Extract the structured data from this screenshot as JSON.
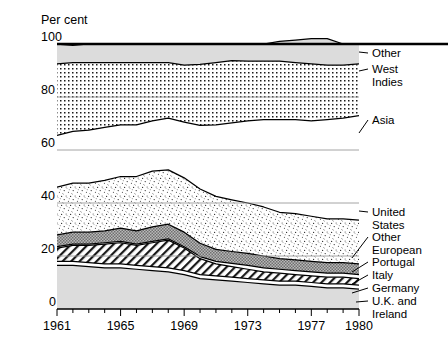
{
  "chart_data": {
    "type": "area",
    "title": "",
    "ylabel": "Per cent",
    "xlabel": "",
    "ylim": [
      0,
      100
    ],
    "xlim": [
      1961,
      1980
    ],
    "grid": true,
    "legend_position": "right",
    "stacked": true,
    "normalized": true,
    "y_ticks": [
      "0",
      "20",
      "40",
      "60",
      "80",
      "100"
    ],
    "y_tick_values": [
      0,
      20,
      40,
      60,
      80,
      100
    ],
    "x_ticks": [
      "1961",
      "1965",
      "1969",
      "1973",
      "1977",
      "1980"
    ],
    "x_tick_values": [
      1961,
      1965,
      1969,
      1973,
      1977,
      1980
    ],
    "x": [
      1961,
      1962,
      1963,
      1964,
      1965,
      1966,
      1967,
      1968,
      1969,
      1970,
      1971,
      1972,
      1973,
      1974,
      1975,
      1976,
      1977,
      1978,
      1979,
      1980
    ],
    "series": [
      {
        "name": "U.K. and Ireland",
        "fill": "light-grey",
        "values": [
          16.5,
          16.5,
          16.0,
          15.5,
          15.5,
          15.0,
          14.5,
          14.0,
          13.0,
          11.5,
          11.0,
          10.5,
          10.0,
          9.5,
          9.0,
          9.0,
          8.5,
          8.0,
          8.0,
          7.5
        ]
      },
      {
        "name": "Germany",
        "fill": "white",
        "values": [
          1.5,
          1.5,
          1.5,
          1.5,
          1.5,
          1.5,
          1.5,
          1.5,
          1.5,
          1.5,
          1.5,
          1.5,
          1.5,
          1.5,
          1.5,
          1.5,
          1.5,
          1.5,
          1.5,
          1.5
        ]
      },
      {
        "name": "Italy",
        "fill": "diagonal-hatch",
        "values": [
          5.0,
          6.0,
          6.5,
          7.5,
          8.0,
          7.5,
          9.0,
          10.5,
          8.5,
          6.0,
          4.5,
          4.0,
          3.5,
          3.0,
          3.0,
          2.5,
          2.5,
          2.5,
          2.5,
          2.5
        ]
      },
      {
        "name": "Portugal",
        "fill": "white",
        "values": [
          0.5,
          0.5,
          0.5,
          0.5,
          0.5,
          0.5,
          0.5,
          0.5,
          0.5,
          0.8,
          1.0,
          1.2,
          1.5,
          1.5,
          1.5,
          1.5,
          1.5,
          1.5,
          1.5,
          1.5
        ]
      },
      {
        "name": "Other European",
        "fill": "dark-grey",
        "values": [
          4.5,
          4.5,
          4.5,
          4.5,
          5.0,
          5.0,
          5.5,
          5.5,
          5.5,
          5.0,
          4.5,
          4.5,
          4.5,
          4.5,
          4.0,
          4.0,
          4.0,
          4.0,
          4.0,
          4.0
        ]
      },
      {
        "name": "United States",
        "fill": "stipple-fine",
        "values": [
          18.0,
          18.5,
          18.5,
          19.0,
          19.5,
          20.5,
          21.0,
          20.5,
          20.5,
          20.5,
          20.0,
          19.5,
          19.0,
          18.5,
          17.5,
          17.5,
          17.0,
          16.5,
          16.5,
          16.5
        ]
      },
      {
        "name": "Asia",
        "fill": "white",
        "values": [
          19.5,
          19.5,
          20.0,
          20.0,
          19.5,
          19.5,
          19.0,
          19.5,
          21.0,
          24.0,
          27.0,
          29.0,
          31.0,
          33.0,
          35.0,
          35.5,
          36.0,
          37.5,
          38.0,
          39.5
        ]
      },
      {
        "name": "West Indies",
        "fill": "dot-grid",
        "values": [
          27.0,
          26.0,
          25.5,
          24.5,
          23.5,
          23.5,
          22.0,
          21.0,
          21.5,
          23.0,
          23.5,
          23.5,
          22.5,
          22.0,
          22.0,
          21.5,
          21.5,
          20.5,
          20.0,
          19.5
        ]
      },
      {
        "name": "Other",
        "fill": "light-grey",
        "values": [
          7.5,
          6.5,
          7.0,
          7.0,
          7.0,
          7.0,
          7.0,
          7.0,
          8.0,
          7.7,
          7.0,
          6.3,
          6.5,
          6.5,
          7.5,
          8.5,
          9.5,
          10.0,
          8.0,
          7.5
        ]
      }
    ],
    "legend": [
      {
        "label_line1": "Other",
        "label_line2": ""
      },
      {
        "label_line1": "West",
        "label_line2": "Indies"
      },
      {
        "label_line1": "Asia",
        "label_line2": ""
      },
      {
        "label_line1": "United",
        "label_line2": "States"
      },
      {
        "label_line1": "Other",
        "label_line2": "European"
      },
      {
        "label_line1": "Portugal",
        "label_line2": ""
      },
      {
        "label_line1": "Italy",
        "label_line2": ""
      },
      {
        "label_line1": "Germany",
        "label_line2": ""
      },
      {
        "label_line1": "U.K. and",
        "label_line2": "Ireland"
      }
    ]
  },
  "axis": {
    "y_title": "Per cent",
    "y_labels": [
      "100",
      "80",
      "60",
      "40",
      "20",
      "0"
    ],
    "x_labels": [
      "1961",
      "1965",
      "1969",
      "1973",
      "1977",
      "1980"
    ]
  },
  "legend_labels": {
    "other_top": "Other",
    "west": "West",
    "indies": "Indies",
    "asia": "Asia",
    "united": "United",
    "states": "States",
    "other_eur_1": "Other",
    "other_eur_2": "European",
    "portugal": "Portugal",
    "italy": "Italy",
    "germany": "Germany",
    "uk_1": "U.K. and",
    "uk_2": "Ireland"
  },
  "colors": {
    "light_grey": "#d6d6d6",
    "dark_grey": "#9c9c9c",
    "ink": "#000000",
    "grid": "#9a9a9a"
  }
}
